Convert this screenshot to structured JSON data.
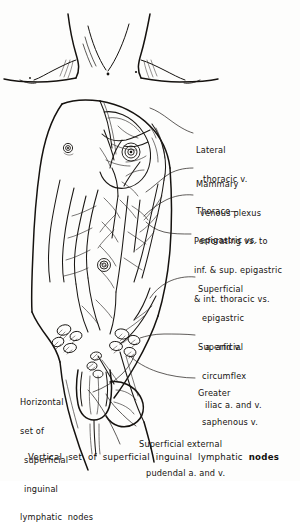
{
  "figure": {
    "style": "hand-drawn pen-and-ink anatomical illustration",
    "background_color": "#fdfdfc",
    "ink_color": "#15120f"
  },
  "labels": [
    {
      "name": "lateral-thoracic-vein",
      "lines": [
        "Lateral",
        "thoracic v."
      ],
      "x": 196,
      "y": 128
    },
    {
      "name": "mammary-venous-plexus",
      "lines": [
        "Mammary",
        "venous plexus"
      ],
      "x": 196,
      "y": 162
    },
    {
      "name": "thoraco-epigastric-veins",
      "lines": [
        "Thoraco—",
        "epigastric vs."
      ],
      "x": 196,
      "y": 189
    },
    {
      "name": "perforating-veins",
      "lines": [
        "Perforating vs. to",
        "inf. & sup. epigastric",
        "& int. thoracic vs."
      ],
      "x": 194,
      "y": 219
    },
    {
      "name": "superficial-epigastric-vessels",
      "lines": [
        "Superficial",
        "epigastric",
        "a. and v."
      ],
      "x": 198,
      "y": 267
    },
    {
      "name": "superficial-circumflex-iliac-vessels",
      "lines": [
        "Superficial",
        "circumflex",
        "iliac a. and v."
      ],
      "x": 198,
      "y": 325
    },
    {
      "name": "greater-saphenous-vein",
      "lines": [
        "Greater",
        "saphenous v."
      ],
      "x": 198,
      "y": 371
    },
    {
      "name": "horizontal-inguinal-nodes",
      "lines": [
        "Horizontal",
        "set of",
        "superficial",
        "inguinal",
        "lymphatic  nodes"
      ],
      "x": 20,
      "y": 380
    },
    {
      "name": "superficial-external-pudendal-vessels",
      "lines": [
        "Superficial external",
        "pudendal a. and v."
      ],
      "x": 139,
      "y": 422
    }
  ],
  "caption": {
    "name": "vertical-inguinal-nodes-caption",
    "prefix": "Vertical  set  of  superficial  inguinal  lymphatic  ",
    "bold": "nodes",
    "x": 28,
    "y": 457
  }
}
